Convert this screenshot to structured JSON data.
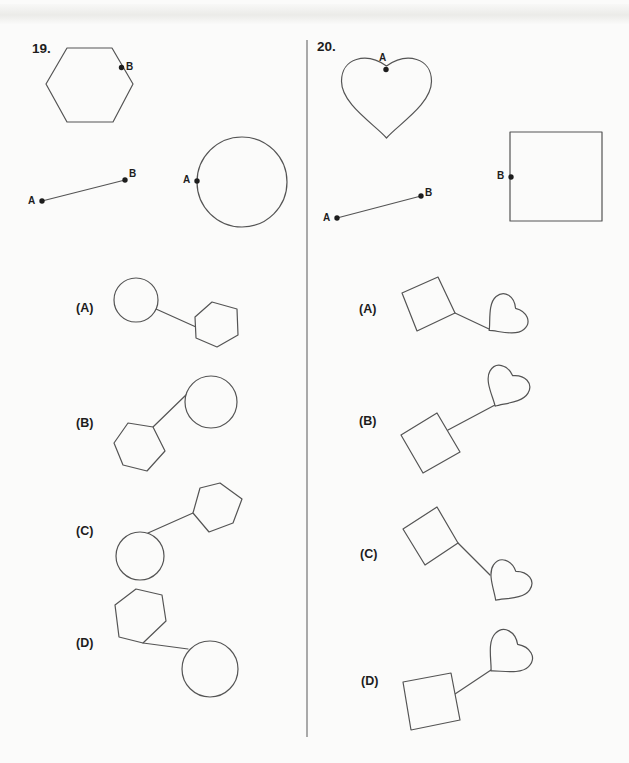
{
  "page": {
    "type": "multiple-choice worksheet scan"
  },
  "colors": {
    "paper": "#fbfbfa",
    "stroke": "#545454",
    "ink": "#1d1d1d",
    "divider": "#a9a9a9"
  },
  "problems": [
    {
      "number": "19.",
      "stimulus": {
        "shape": "hexagon",
        "shape_point_label": "B",
        "segment_start_label": "A",
        "segment_end_label": "B",
        "target_shape": "circle",
        "target_point_label": "A"
      },
      "choices": [
        {
          "label": "(A)",
          "arrangement": "circle upper-left connected to hexagon lower-right"
        },
        {
          "label": "(B)",
          "arrangement": "hexagon lower-left connected to circle upper-right"
        },
        {
          "label": "(C)",
          "arrangement": "circle lower-left connected to hexagon upper-right"
        },
        {
          "label": "(D)",
          "arrangement": "hexagon upper-left connected to circle lower-right"
        }
      ]
    },
    {
      "number": "20.",
      "stimulus": {
        "shape": "heart",
        "shape_point_label": "A",
        "segment_start_label": "A",
        "segment_end_label": "B",
        "target_shape": "square",
        "target_point_label": "B"
      },
      "choices": [
        {
          "label": "(A)",
          "arrangement": "tilted square left connected to rotated heart right"
        },
        {
          "label": "(B)",
          "arrangement": "tilted square lower-left connected to heart upper-right"
        },
        {
          "label": "(C)",
          "arrangement": "tilted square upper-left connected to heart lower-right"
        },
        {
          "label": "(D)",
          "arrangement": "square lower-left connected to rotated heart upper-right"
        }
      ]
    }
  ]
}
